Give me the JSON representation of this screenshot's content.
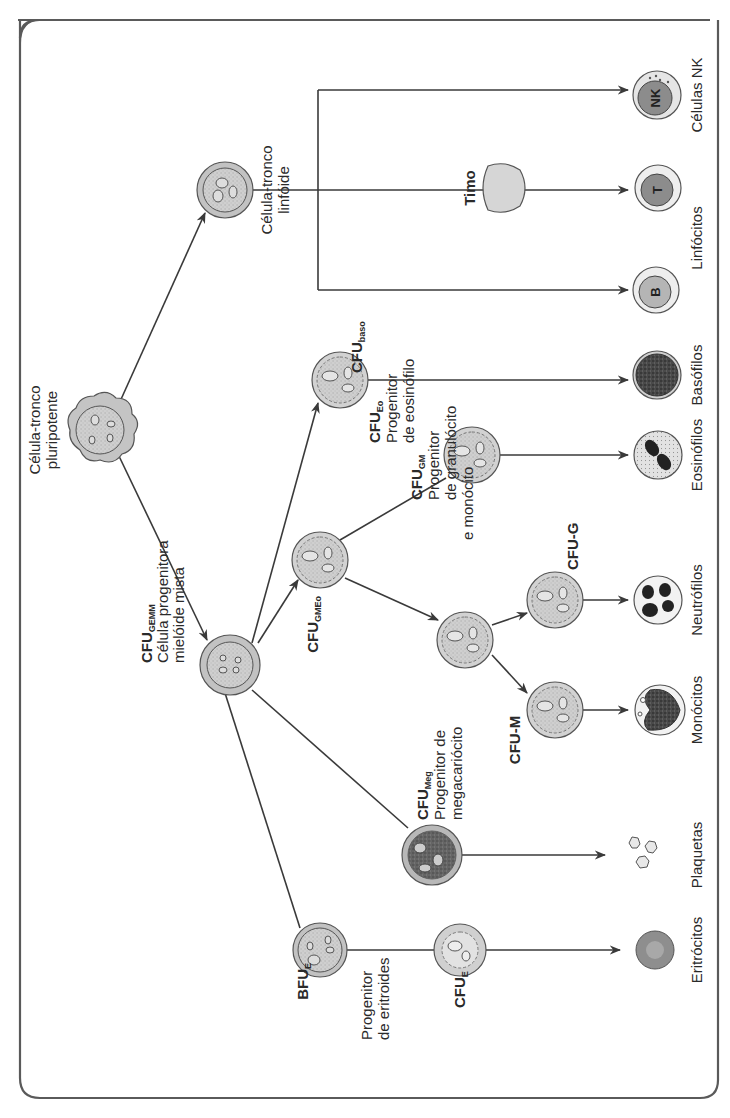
{
  "figure": {
    "orientation": "rotated -90deg (text reads bottom-to-top)",
    "colors": {
      "line": "#3a3a3a",
      "frame": "#555555",
      "cell_fill": "#c9c9c9",
      "cell_inner": "#d8d8d8",
      "dark_cell": "#555555",
      "background": "#ffffff"
    }
  },
  "nodes": {
    "pluripotent": {
      "line1": "Célula-tronco",
      "line2": "pluripotente"
    },
    "lymphoid": {
      "line1": "Célula-tronco",
      "line2": "linfóide"
    },
    "gemm": {
      "name": "CFU",
      "sub": "GEMM",
      "line1": "Célula progenitora",
      "line2": "mielóide mista"
    },
    "gmeo": {
      "name": "CFU",
      "sub": "GMEo"
    },
    "baso": {
      "name": "CFU",
      "sub": "baso"
    },
    "eo": {
      "name": "CFU",
      "sub": "Eo",
      "line1": "Progenitor",
      "line2": "de eosinófilo"
    },
    "gm": {
      "name": "CFU",
      "sub": "GM",
      "line1": "Progenitor",
      "line2": "de granulócito",
      "line3": "e monócito"
    },
    "cfu_g": {
      "name": "CFU-G"
    },
    "cfu_m": {
      "name": "CFU-M"
    },
    "meg": {
      "name": "CFU",
      "sub": "Meg",
      "line1": "Progenitor de",
      "line2": "megacariócito"
    },
    "bfu_e": {
      "name": "BFU",
      "sub": "E"
    },
    "erythroid_progenitor": {
      "line1": "Progenitor",
      "line2": "de eritroides"
    },
    "cfu_e": {
      "name": "CFU",
      "sub": "E"
    },
    "thymus": {
      "label": "Timo"
    }
  },
  "mature_cells": {
    "nk": {
      "letter": "NK",
      "label": "Células NK"
    },
    "t": {
      "letter": "T"
    },
    "b": {
      "letter": "B"
    },
    "lymphocytes_label": "Linfócitos",
    "basophils": "Basófilos",
    "eosinophils": "Eosinófilos",
    "neutrophils": "Neutrófilos",
    "monocytes": "Monócitos",
    "platelets": "Plaquetas",
    "erythrocytes": "Eritrócitos"
  }
}
